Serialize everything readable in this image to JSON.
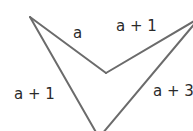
{
  "diagram": {
    "type": "concave quadrilateral (arrowhead / dart)",
    "stroke_color": "#6b6b6b",
    "text_color": "#2a2a2a",
    "labels": {
      "top_left_side": "a",
      "top_right_side": "a + 1",
      "left_side": "a + 1",
      "right_side": "a + 3"
    }
  }
}
